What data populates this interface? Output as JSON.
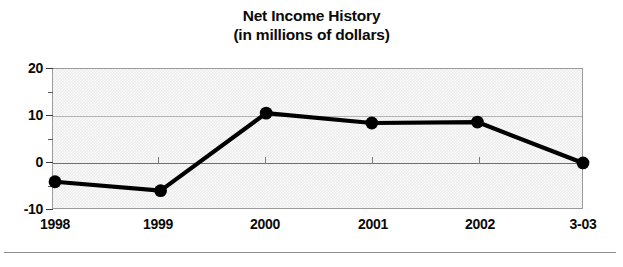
{
  "chart_data": {
    "type": "line",
    "title": "Net Income History",
    "subtitle": "(in millions of dollars)",
    "xlabel": "",
    "ylabel": "",
    "categories": [
      "1998",
      "1999",
      "2000",
      "2001",
      "2002",
      "3-03"
    ],
    "values": [
      -4.2,
      -6.1,
      10.4,
      8.3,
      8.5,
      -0.2
    ],
    "series": [
      {
        "name": "Net Income",
        "values": [
          -4.2,
          -6.1,
          10.4,
          8.3,
          8.5,
          -0.2
        ]
      }
    ],
    "ylim": [
      -10,
      20
    ],
    "yticks": [
      20,
      10,
      0,
      -10
    ],
    "ytick_labels": [
      "20",
      "10",
      "0",
      "-10"
    ],
    "yminor_ticks": [
      15,
      5,
      -5
    ],
    "grid": true,
    "legend": false,
    "legend_position": "none",
    "units": "millions of dollars",
    "marker": "filled-circle",
    "line_color": "#000000",
    "marker_color": "#000000",
    "plot_background": "#ededed",
    "axis_color": "#6e6e6e",
    "gridline_color": "#b4b4b4"
  },
  "title": {
    "line1": "Net Income History",
    "line2": "(in millions of dollars)"
  },
  "axes": {
    "y": {
      "labels": [
        "20",
        "10",
        "0",
        "-10"
      ]
    },
    "x": {
      "labels": [
        "1998",
        "1999",
        "2000",
        "2001",
        "2002",
        "3-03"
      ]
    }
  }
}
